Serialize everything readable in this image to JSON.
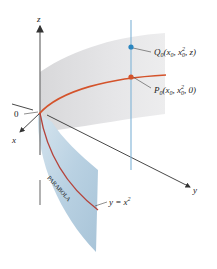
{
  "figure": {
    "type": "3D surface diagram",
    "axes": {
      "x_label": "x",
      "y_label": "y",
      "z_label": "z",
      "origin_label": "0"
    },
    "points": {
      "Q0": {
        "label_name": "Q",
        "label_sub": "0",
        "label_args": "(x",
        "label_args_sub": "0",
        "label_mid": ", x",
        "label_mid_sub": "0",
        "label_mid_sup": "2",
        "label_end": ", z)",
        "color": "#2a86c0"
      },
      "P0": {
        "label_name": "P",
        "label_sub": "0",
        "label_args": "(x",
        "label_args_sub": "0",
        "label_mid": ", x",
        "label_mid_sub": "0",
        "label_mid_sup": "2",
        "label_end": ", 0)",
        "color": "#d4532b"
      }
    },
    "curve_label": {
      "text": "y = x",
      "sup": "2"
    },
    "surface_label": "PARABOLA",
    "colors": {
      "cylinder_surface": "#e3e3e5",
      "blue_surface": "#b6cfe0",
      "parabola_curve": "#d4532b",
      "vertical_line": "#7fb3d6",
      "axis": "#333333"
    }
  }
}
